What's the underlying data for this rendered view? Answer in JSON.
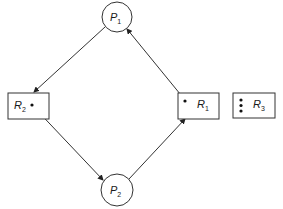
{
  "diagram": {
    "type": "resource-allocation-graph",
    "processes": [
      {
        "id": "P1",
        "letter": "P",
        "sub": "1",
        "cx": 117,
        "cy": 17,
        "r": 15
      },
      {
        "id": "P2",
        "letter": "P",
        "sub": "2",
        "cx": 117,
        "cy": 190,
        "r": 16
      }
    ],
    "resources": [
      {
        "id": "R2",
        "letter": "R",
        "sub": "2",
        "x": 8,
        "y": 93,
        "w": 41,
        "h": 26,
        "instances": 1
      },
      {
        "id": "R1",
        "letter": "R",
        "sub": "1",
        "x": 178,
        "y": 93,
        "w": 41,
        "h": 26,
        "instances": 1
      },
      {
        "id": "R3",
        "letter": "R",
        "sub": "3",
        "x": 233,
        "y": 93,
        "w": 42,
        "h": 25,
        "instances": 3
      }
    ],
    "edges": [
      {
        "from": "P1",
        "to": "R2",
        "kind": "request"
      },
      {
        "from": "R2",
        "to": "P2",
        "kind": "assignment"
      },
      {
        "from": "P2",
        "to": "R1",
        "kind": "request"
      },
      {
        "from": "R1",
        "to": "P1",
        "kind": "assignment"
      }
    ],
    "stroke_color": "#333333"
  }
}
